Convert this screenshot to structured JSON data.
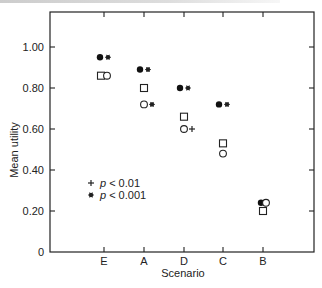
{
  "chart_data": {
    "type": "scatter",
    "title": "",
    "xlabel": "Scenario",
    "ylabel": "Mean utility",
    "categories": [
      "E",
      "A",
      "D",
      "C",
      "B"
    ],
    "yticks": [
      "0",
      "0.20",
      "0.40",
      "0.60",
      "0.80",
      "1.00"
    ],
    "ylim": [
      0,
      1.1
    ],
    "grid": false,
    "series": [
      {
        "name": "filled circle",
        "marker": "filled-circle",
        "values": [
          0.95,
          0.89,
          0.8,
          0.72,
          0.24
        ]
      },
      {
        "name": "open square",
        "marker": "open-square",
        "values": [
          0.86,
          0.8,
          0.66,
          0.53,
          0.2
        ]
      },
      {
        "name": "open circle",
        "marker": "open-circle",
        "values": [
          0.86,
          0.72,
          0.6,
          0.48,
          0.24
        ]
      }
    ],
    "significance": [
      {
        "category": "E",
        "series": "filled circle",
        "mark": "*"
      },
      {
        "category": "A",
        "series": "filled circle",
        "mark": "*"
      },
      {
        "category": "A",
        "series": "open circle",
        "mark": "*"
      },
      {
        "category": "D",
        "series": "filled circle",
        "mark": "*"
      },
      {
        "category": "D",
        "series": "open circle",
        "mark": "+"
      },
      {
        "category": "C",
        "series": "filled circle",
        "mark": "*"
      }
    ],
    "legend": [
      {
        "symbol": "+",
        "text": "p < 0.01"
      },
      {
        "symbol": "*",
        "text": "p < 0.001"
      }
    ],
    "legend_position": "lower-left inside"
  },
  "labels": {
    "x_axis": "Scenario",
    "y_axis": "Mean utility",
    "legend_plus_p": "p",
    "legend_plus_val": "< 0.01",
    "legend_star_p": "p",
    "legend_star_val": "< 0.001"
  }
}
